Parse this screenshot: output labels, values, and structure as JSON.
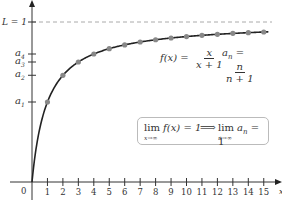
{
  "chart_data": {
    "type": "line",
    "title": "",
    "xlabel": "x",
    "ylabel": "",
    "x_ticks": [
      1,
      2,
      3,
      4,
      5,
      6,
      7,
      8,
      9,
      10,
      11,
      12,
      13,
      14,
      15
    ],
    "origin_label": "0",
    "xlim": [
      0,
      16
    ],
    "ylim": [
      0,
      1.1
    ],
    "grid": false,
    "series": [
      {
        "name": "f(x) = x/(x+1)",
        "kind": "curve",
        "color": "#222222"
      },
      {
        "name": "a_n = n/(n+1)",
        "kind": "points",
        "color": "#888888",
        "x": [
          1,
          2,
          3,
          4,
          5,
          6,
          7,
          8,
          9,
          10,
          11,
          12,
          13,
          14,
          15
        ],
        "values": [
          0.5,
          0.667,
          0.75,
          0.8,
          0.833,
          0.857,
          0.875,
          0.889,
          0.9,
          0.909,
          0.917,
          0.923,
          0.929,
          0.933,
          0.9375
        ]
      }
    ],
    "asymptote": {
      "label": "L = 1",
      "y": 1,
      "style": "dashed",
      "color": "#999999"
    },
    "y_axis_labels": [
      {
        "text": "a",
        "sub": "1",
        "y": 0.5
      },
      {
        "text": "a",
        "sub": "2",
        "y": 0.667
      },
      {
        "text": "a",
        "sub": "3",
        "y": 0.75
      },
      {
        "text": "a",
        "sub": "4",
        "y": 0.8
      }
    ],
    "annotations": [
      "f(x) = x/(x+1)",
      "a_n = n/(n+1)",
      "lim_{x→∞} f(x) = 1 ⟹ lim_{n→∞} a_n = 1"
    ]
  },
  "formula": {
    "f_lhs": "f(x) =",
    "f_num": "x",
    "f_den": "x + 1",
    "a_lhs": "a",
    "a_sub": "n",
    "a_eq": " =",
    "a_num": "n",
    "a_den": "n + 1"
  },
  "limit_box": {
    "lim1": "lim",
    "lim1_sub": "x→∞",
    "lim1_rest": " f(x) = 1",
    "arrow": "⟹",
    "lim2": "lim",
    "lim2_sub": "n→∞",
    "lim2_rest_a": " a",
    "lim2_rest_sub": "n",
    "lim2_rest_eq": " = 1"
  },
  "labels": {
    "L": "L = 1",
    "origin": "0",
    "x_axis": "x"
  }
}
